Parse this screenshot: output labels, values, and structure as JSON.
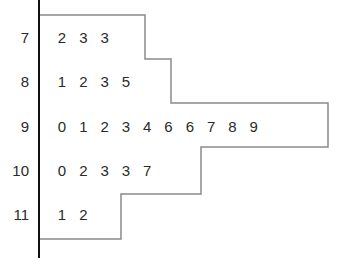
{
  "chart_data": {
    "type": "table",
    "subtype": "stem-and-leaf",
    "title": "",
    "stems": [
      "7",
      "8",
      "9",
      "10",
      "11"
    ],
    "rows": [
      {
        "stem": "7",
        "leaves": [
          "2",
          "3",
          "3"
        ]
      },
      {
        "stem": "8",
        "leaves": [
          "1",
          "2",
          "3",
          "5"
        ]
      },
      {
        "stem": "9",
        "leaves": [
          "0",
          "1",
          "2",
          "3",
          "4",
          "6",
          "6",
          "7",
          "8",
          "9"
        ]
      },
      {
        "stem": "10",
        "leaves": [
          "0",
          "2",
          "3",
          "3",
          "7"
        ]
      },
      {
        "stem": "11",
        "leaves": [
          "1",
          "2"
        ]
      }
    ],
    "values": [
      72,
      73,
      73,
      81,
      82,
      83,
      85,
      90,
      91,
      92,
      93,
      94,
      96,
      96,
      97,
      98,
      99,
      100,
      102,
      103,
      103,
      107,
      111,
      112
    ],
    "outline": "histogram-like outline enclosing leaves",
    "colors": {
      "text": "#2a2a2a",
      "axis": "#111111",
      "outline": "#8a8a8a"
    }
  }
}
